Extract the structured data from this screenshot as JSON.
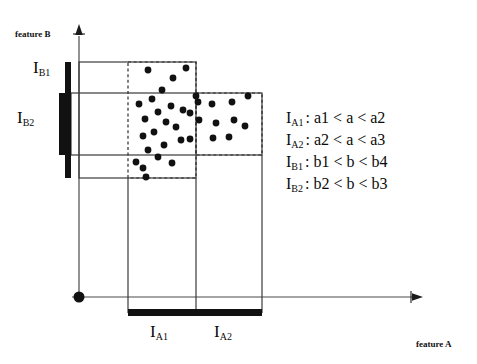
{
  "figure": {
    "axes": {
      "x_label": "feature A",
      "y_label": "feature B",
      "origin_marker": "origin-dot"
    },
    "interval_labels": {
      "a1": "I",
      "a1_sub": "A1",
      "a2": "I",
      "a2_sub": "A2",
      "b1": "I",
      "b1_sub": "B1",
      "b2": "I",
      "b2_sub": "B2"
    },
    "legend": [
      {
        "label": "I",
        "sub": "A1",
        "expr": ": a1 < a < a2"
      },
      {
        "label": "I",
        "sub": "A2",
        "expr": ": a2 < a < a3"
      },
      {
        "label": "I",
        "sub": "B1",
        "expr": ": b1 < b < b4"
      },
      {
        "label": "I",
        "sub": "B2",
        "expr": ": b2 < b < b3"
      }
    ],
    "colors": {
      "ink": "#0a0a0a",
      "line": "#3a3a3a",
      "dash": "#2b2b2b",
      "bar": "#111111",
      "point": "#111111",
      "background": "#ffffff"
    }
  },
  "chart_data": {
    "type": "scatter",
    "title": "",
    "xlabel": "feature A",
    "ylabel": "feature B",
    "grid": false,
    "legend_position": "right",
    "xlim": [
      0,
      477
    ],
    "ylim": [
      364,
      0
    ],
    "note": "Pixel coordinates of scatter points as drawn in the figure (y grows downward).",
    "series": [
      {
        "name": "cluster-IA1",
        "points": [
          [
            148,
            70
          ],
          [
            173,
            78
          ],
          [
            186,
            68
          ],
          [
            162,
            90
          ],
          [
            139,
            104
          ],
          [
            152,
            99
          ],
          [
            158,
            112
          ],
          [
            171,
            106
          ],
          [
            183,
            110
          ],
          [
            190,
            113
          ],
          [
            145,
            119
          ],
          [
            166,
            122
          ],
          [
            176,
            127
          ],
          [
            143,
            136
          ],
          [
            154,
            132
          ],
          [
            181,
            140
          ],
          [
            190,
            139
          ],
          [
            164,
            145
          ],
          [
            148,
            150
          ],
          [
            158,
            157
          ],
          [
            172,
            163
          ],
          [
            143,
            168
          ],
          [
            146,
            177
          ],
          [
            136,
            162
          ],
          [
            199,
            120
          ],
          [
            196,
            96
          ]
        ]
      },
      {
        "name": "cluster-IA2",
        "points": [
          [
            198,
            102
          ],
          [
            212,
            104
          ],
          [
            232,
            102
          ],
          [
            248,
            96
          ],
          [
            216,
            123
          ],
          [
            234,
            120
          ],
          [
            245,
            126
          ],
          [
            213,
            138
          ],
          [
            229,
            137
          ]
        ]
      }
    ],
    "regions": [
      {
        "name": "solid-box-IB1",
        "x0": 79,
        "y0": 62,
        "x1": 196,
        "y1": 178,
        "style": "solid"
      },
      {
        "name": "dashed-box-IA1",
        "x0": 128,
        "y0": 62,
        "x1": 196,
        "y1": 178,
        "style": "dashed"
      },
      {
        "name": "dashed-box-IA2",
        "x0": 196,
        "y0": 93,
        "x1": 262,
        "y1": 155,
        "style": "dashed"
      },
      {
        "name": "solid-box-IB2",
        "x0": 71,
        "y0": 93,
        "x1": 262,
        "y1": 155,
        "style": "solid"
      }
    ],
    "interval_bars": [
      {
        "name": "IB1-bar",
        "orientation": "vertical",
        "x": 68,
        "y0": 62,
        "y1": 178
      },
      {
        "name": "IB2-bar",
        "orientation": "vertical",
        "x": 62,
        "y0": 93,
        "y1": 155
      },
      {
        "name": "IA1-IA2-bar",
        "orientation": "horizontal",
        "y": 313,
        "x0": 128,
        "x1": 262
      }
    ]
  }
}
